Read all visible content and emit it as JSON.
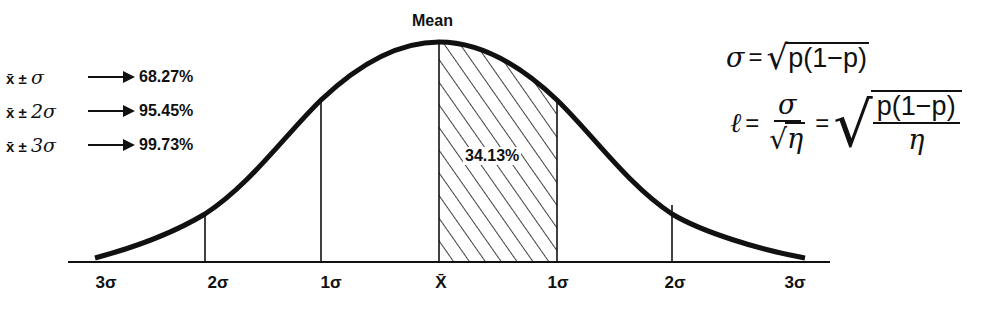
{
  "diagram": {
    "mean_label": "Mean",
    "center_region_pct": "34.13%",
    "axis_labels": [
      "3σ",
      "2σ",
      "1σ",
      "X̄",
      "1σ",
      "2σ",
      "3σ"
    ],
    "rules": [
      {
        "expr_prefix": "x̄ ±",
        "expr_sigma": "σ",
        "pct": "68.27%"
      },
      {
        "expr_prefix": "x̄ ±",
        "expr_sigma": "2σ",
        "pct": "95.45%"
      },
      {
        "expr_prefix": "x̄ ±",
        "expr_sigma": "3σ",
        "pct": "99.73%"
      }
    ],
    "formulas": {
      "sigma_lhs": "σ",
      "sigma_rhs_radicand": "p(1−p)",
      "ell_lhs": "ℓ",
      "ell_frac_num": "σ",
      "ell_frac_den_radicand": "η",
      "ell_rhs_num": "p(1−p)",
      "ell_rhs_den": "η"
    },
    "colors": {
      "ink": "#111111",
      "background": "#ffffff"
    }
  }
}
